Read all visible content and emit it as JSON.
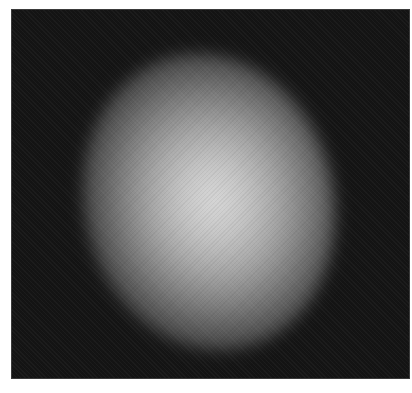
{
  "image": {
    "description": "Grayscale blurred bright elliptical blob centered on a dark background",
    "colors": {
      "background": "#141414",
      "center": "#d8d8d8",
      "page": "#ffffff"
    }
  }
}
